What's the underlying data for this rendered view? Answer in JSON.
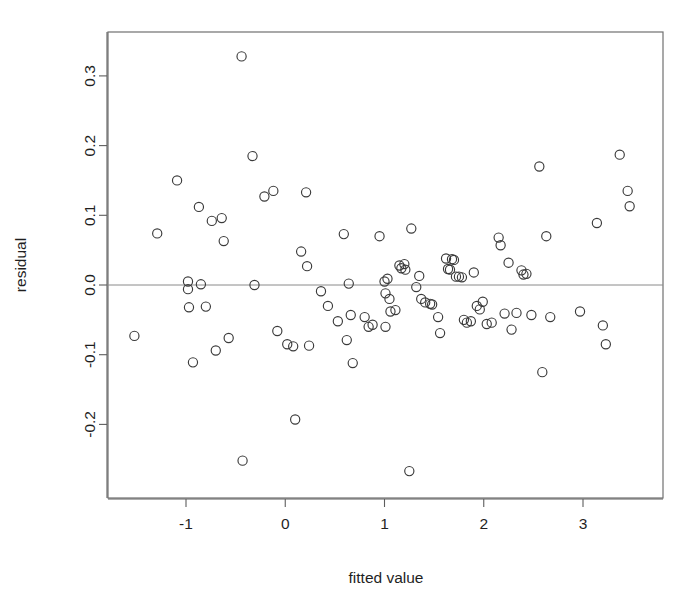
{
  "chart_data": {
    "type": "scatter",
    "title": "",
    "subtitle": "",
    "xlabel": "fitted value",
    "ylabel": "residual",
    "xlim": [
      -1.6,
      3.6
    ],
    "ylim": [
      -0.29,
      0.35
    ],
    "xticks": [
      -1,
      0,
      1,
      2,
      3
    ],
    "xticklabels": [
      "-1",
      "0",
      "1",
      "2",
      "3"
    ],
    "yticks": [
      -0.2,
      -0.1,
      0.0,
      0.1,
      0.2,
      0.3
    ],
    "yticklabels": [
      "-0.2",
      "-0.1",
      "0.0",
      "0.1",
      "0.2",
      "0.3"
    ],
    "grid": false,
    "legend": null,
    "annotations": [
      {
        "kind": "hline",
        "y": 0.0,
        "color": "#8a8a8a"
      }
    ],
    "marker": {
      "shape": "circle-open",
      "size": 5.0,
      "color": "#3a3a3a"
    },
    "n_points": 96,
    "points": [
      {
        "x": -1.52,
        "y": -0.073
      },
      {
        "x": -1.29,
        "y": 0.074
      },
      {
        "x": -1.09,
        "y": 0.15
      },
      {
        "x": -0.98,
        "y": 0.005
      },
      {
        "x": -0.98,
        "y": -0.006
      },
      {
        "x": -0.97,
        "y": -0.032
      },
      {
        "x": -0.93,
        "y": -0.111
      },
      {
        "x": -0.87,
        "y": 0.112
      },
      {
        "x": -0.85,
        "y": 0.001
      },
      {
        "x": -0.8,
        "y": -0.031
      },
      {
        "x": -0.74,
        "y": 0.092
      },
      {
        "x": -0.7,
        "y": -0.094
      },
      {
        "x": -0.64,
        "y": 0.096
      },
      {
        "x": -0.62,
        "y": 0.063
      },
      {
        "x": -0.57,
        "y": -0.076
      },
      {
        "x": -0.44,
        "y": 0.328
      },
      {
        "x": -0.43,
        "y": -0.252
      },
      {
        "x": -0.33,
        "y": 0.185
      },
      {
        "x": -0.31,
        "y": 0.0
      },
      {
        "x": -0.21,
        "y": 0.127
      },
      {
        "x": -0.12,
        "y": 0.135
      },
      {
        "x": -0.08,
        "y": -0.066
      },
      {
        "x": 0.02,
        "y": -0.085
      },
      {
        "x": 0.08,
        "y": -0.088
      },
      {
        "x": 0.1,
        "y": -0.193
      },
      {
        "x": 0.16,
        "y": 0.048
      },
      {
        "x": 0.21,
        "y": 0.133
      },
      {
        "x": 0.22,
        "y": 0.027
      },
      {
        "x": 0.24,
        "y": -0.087
      },
      {
        "x": 0.36,
        "y": -0.009
      },
      {
        "x": 0.43,
        "y": -0.03
      },
      {
        "x": 0.53,
        "y": -0.052
      },
      {
        "x": 0.59,
        "y": 0.073
      },
      {
        "x": 0.62,
        "y": -0.079
      },
      {
        "x": 0.64,
        "y": 0.002
      },
      {
        "x": 0.66,
        "y": -0.043
      },
      {
        "x": 0.68,
        "y": -0.112
      },
      {
        "x": 0.8,
        "y": -0.046
      },
      {
        "x": 0.84,
        "y": -0.06
      },
      {
        "x": 0.88,
        "y": -0.057
      },
      {
        "x": 0.95,
        "y": 0.07
      },
      {
        "x": 1.0,
        "y": 0.005
      },
      {
        "x": 1.01,
        "y": -0.012
      },
      {
        "x": 1.01,
        "y": -0.06
      },
      {
        "x": 1.03,
        "y": 0.009
      },
      {
        "x": 1.05,
        "y": -0.02
      },
      {
        "x": 1.06,
        "y": -0.038
      },
      {
        "x": 1.11,
        "y": -0.036
      },
      {
        "x": 1.15,
        "y": 0.028
      },
      {
        "x": 1.17,
        "y": 0.024
      },
      {
        "x": 1.2,
        "y": 0.03
      },
      {
        "x": 1.21,
        "y": 0.022
      },
      {
        "x": 1.25,
        "y": -0.267
      },
      {
        "x": 1.27,
        "y": 0.081
      },
      {
        "x": 1.32,
        "y": -0.003
      },
      {
        "x": 1.35,
        "y": 0.013
      },
      {
        "x": 1.37,
        "y": -0.02
      },
      {
        "x": 1.41,
        "y": -0.025
      },
      {
        "x": 1.46,
        "y": -0.027
      },
      {
        "x": 1.48,
        "y": -0.028
      },
      {
        "x": 1.54,
        "y": -0.046
      },
      {
        "x": 1.56,
        "y": -0.069
      },
      {
        "x": 1.62,
        "y": 0.038
      },
      {
        "x": 1.64,
        "y": 0.023
      },
      {
        "x": 1.66,
        "y": 0.022
      },
      {
        "x": 1.68,
        "y": 0.037
      },
      {
        "x": 1.7,
        "y": 0.036
      },
      {
        "x": 1.72,
        "y": 0.012
      },
      {
        "x": 1.75,
        "y": 0.012
      },
      {
        "x": 1.78,
        "y": 0.011
      },
      {
        "x": 1.8,
        "y": -0.05
      },
      {
        "x": 1.83,
        "y": -0.054
      },
      {
        "x": 1.87,
        "y": -0.052
      },
      {
        "x": 1.9,
        "y": 0.018
      },
      {
        "x": 1.93,
        "y": -0.03
      },
      {
        "x": 1.96,
        "y": -0.035
      },
      {
        "x": 1.99,
        "y": -0.024
      },
      {
        "x": 2.03,
        "y": -0.056
      },
      {
        "x": 2.08,
        "y": -0.054
      },
      {
        "x": 2.15,
        "y": 0.068
      },
      {
        "x": 2.17,
        "y": 0.057
      },
      {
        "x": 2.21,
        "y": -0.041
      },
      {
        "x": 2.25,
        "y": 0.032
      },
      {
        "x": 2.28,
        "y": -0.064
      },
      {
        "x": 2.33,
        "y": -0.04
      },
      {
        "x": 2.38,
        "y": 0.021
      },
      {
        "x": 2.4,
        "y": 0.015
      },
      {
        "x": 2.43,
        "y": 0.016
      },
      {
        "x": 2.48,
        "y": -0.043
      },
      {
        "x": 2.56,
        "y": 0.17
      },
      {
        "x": 2.59,
        "y": -0.125
      },
      {
        "x": 2.63,
        "y": 0.07
      },
      {
        "x": 2.67,
        "y": -0.046
      },
      {
        "x": 2.97,
        "y": -0.038
      },
      {
        "x": 3.14,
        "y": 0.089
      },
      {
        "x": 3.2,
        "y": -0.058
      },
      {
        "x": 3.23,
        "y": -0.085
      },
      {
        "x": 3.37,
        "y": 0.187
      },
      {
        "x": 3.45,
        "y": 0.135
      },
      {
        "x": 3.47,
        "y": 0.113
      }
    ]
  },
  "geometry": {
    "frame": {
      "left": 108,
      "top": 32,
      "right": 663,
      "bottom": 498
    },
    "x_pix_at_minus1": 186,
    "x_pix_per_unit": 99.25,
    "y_pix_at_zero": 285,
    "y_pix_per_unit": 697
  }
}
